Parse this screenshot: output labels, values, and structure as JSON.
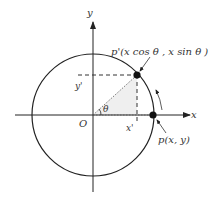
{
  "diagram": {
    "type": "rotation-on-unit-circle",
    "axes": {
      "x_label": "x",
      "y_label": "y",
      "origin_label": "O"
    },
    "points": {
      "p": {
        "label": "p(x, y)"
      },
      "p_prime": {
        "label": "p'(x cos θ , x sin θ )"
      }
    },
    "projections": {
      "x_prime": "x'",
      "y_prime": "y'"
    },
    "angle_label": "θ",
    "colors": {
      "line": "#222222",
      "dashed": "#333333",
      "shade": "#eeeeee",
      "point": "#111111"
    }
  }
}
